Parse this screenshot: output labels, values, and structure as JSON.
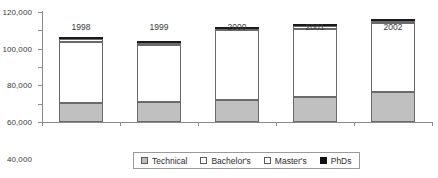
{
  "chart_data": {
    "type": "bar",
    "stacked": true,
    "title": "",
    "subtitle": "",
    "xlabel": "",
    "ylabel": "",
    "categories": [
      "1998",
      "1999",
      "2000",
      "2001",
      "2002"
    ],
    "ylim": [
      0,
      120000
    ],
    "ytick_values": [
      0,
      20000,
      40000,
      60000,
      80000,
      100000,
      120000
    ],
    "ytick_labels": [
      "0",
      "20,000",
      "40,000",
      "60,000",
      "80,000",
      "100,000",
      "120,000"
    ],
    "grid": false,
    "legend_position": "bottom",
    "series": [
      {
        "name": "Technical",
        "color": "#c0c0c0",
        "values": [
          21000,
          22000,
          23500,
          27000,
          32500
        ]
      },
      {
        "name": "Bachelor's",
        "color": "#ffffff",
        "values": [
          66000,
          62000,
          77000,
          75000,
          76000
        ]
      },
      {
        "name": "Master's",
        "color": "#fdfdfd",
        "values": [
          3500,
          2000,
          1000,
          3000,
          1500
        ]
      },
      {
        "name": "PhDs",
        "color": "#1a1a1a",
        "values": [
          1000,
          500,
          500,
          500,
          500
        ]
      }
    ],
    "totals": [
      91500,
      86500,
      102000,
      105500,
      110500
    ]
  },
  "legend": {
    "items": [
      {
        "label": "Technical",
        "swatch": "swatch-technical"
      },
      {
        "label": "Bachelor's",
        "swatch": "swatch-bachelors"
      },
      {
        "label": "Master's",
        "swatch": "swatch-masters"
      },
      {
        "label": "PhDs",
        "swatch": "swatch-phds"
      }
    ]
  }
}
